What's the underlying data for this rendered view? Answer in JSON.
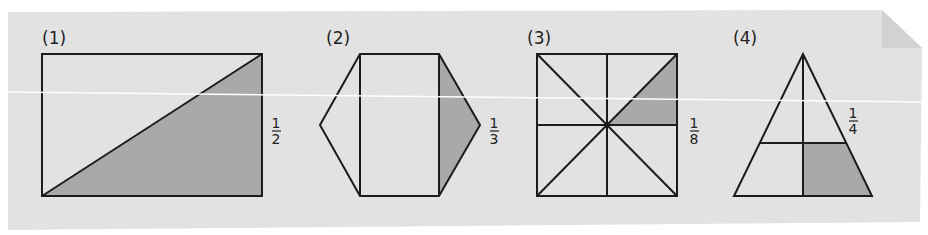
{
  "colors": {
    "page_background": "#ffffff",
    "panel_background": "#e2e2e2",
    "fold_corner": "#cfcfcf",
    "stroke": "#1c1c1c",
    "shade": "#a9a9a9",
    "scan_line": "#ffffff"
  },
  "figures": [
    {
      "id": 1,
      "label": "(1)",
      "shape": "rectangle",
      "division": "split by one diagonal into 2 equal triangles",
      "shaded_parts": 1,
      "total_parts": 2,
      "fraction": {
        "numerator": "1",
        "denominator": "2"
      }
    },
    {
      "id": 2,
      "label": "(2)",
      "shape": "hexagon",
      "division": "rectangle with two side triangles",
      "shaded_parts": 1,
      "total_parts": 3,
      "fraction": {
        "numerator": "1",
        "denominator": "3"
      }
    },
    {
      "id": 3,
      "label": "(3)",
      "shape": "square",
      "division": "split by both diagonals and both midlines into 8 triangles",
      "shaded_parts": 1,
      "total_parts": 8,
      "fraction": {
        "numerator": "1",
        "denominator": "8"
      }
    },
    {
      "id": 4,
      "label": "(4)",
      "shape": "triangle",
      "division": "split by vertical median and horizontal line",
      "shaded_parts": 1,
      "total_parts": 4,
      "fraction": {
        "numerator": "1",
        "denominator": "4"
      }
    }
  ]
}
